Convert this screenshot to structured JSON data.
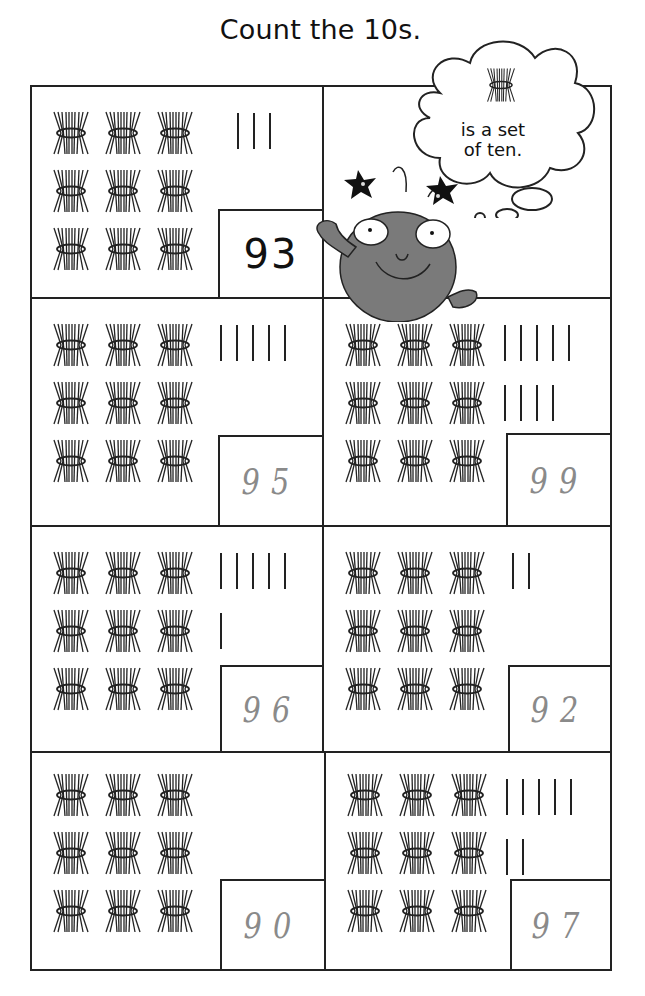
{
  "worksheet": {
    "title": "Count the 10s.",
    "hint": {
      "icon": "bundle-of-ten-icon",
      "text_line1": "is a set",
      "text_line2": "of ten."
    },
    "mascot": "smiling-bug-character",
    "colors": {
      "ink": "#222222",
      "handwriting": "#8a8a8a",
      "mascot_body": "#7a7a7a",
      "background": "#ffffff"
    },
    "problems": [
      {
        "id": 1,
        "tens_bundles": 9,
        "ones_tallies": 3,
        "answer": "93",
        "answer_style": "printed-example"
      },
      {
        "id": 2,
        "tens_bundles": 9,
        "ones_tallies": 5,
        "answer": "95",
        "answer_style": "handwritten"
      },
      {
        "id": 3,
        "tens_bundles": 9,
        "ones_tallies": 9,
        "answer": "99",
        "answer_style": "handwritten"
      },
      {
        "id": 4,
        "tens_bundles": 9,
        "ones_tallies": 6,
        "answer": "96",
        "answer_style": "handwritten"
      },
      {
        "id": 5,
        "tens_bundles": 9,
        "ones_tallies": 2,
        "answer": "92",
        "answer_style": "handwritten"
      },
      {
        "id": 6,
        "tens_bundles": 9,
        "ones_tallies": 0,
        "answer": "90",
        "answer_style": "handwritten"
      },
      {
        "id": 7,
        "tens_bundles": 9,
        "ones_tallies": 7,
        "answer": "97",
        "answer_style": "handwritten"
      }
    ]
  }
}
